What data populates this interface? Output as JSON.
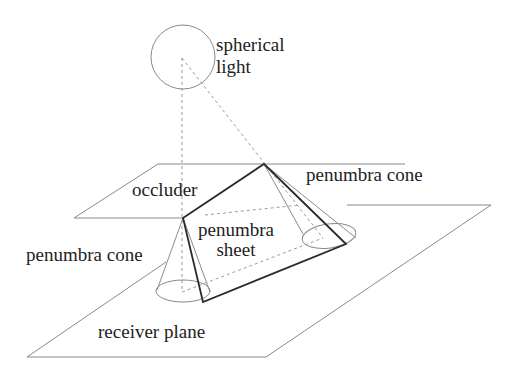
{
  "diagram": {
    "type": "3d-geometry-illustration",
    "labels": {
      "spherical_light_line1": "spherical",
      "spherical_light_line2": "light",
      "occluder": "occluder",
      "penumbra_cone_right": "penumbra cone",
      "penumbra_cone_left": "penumbra cone",
      "penumbra_sheet_line1": "penumbra",
      "penumbra_sheet_line2": "sheet",
      "receiver_plane": "receiver plane"
    },
    "colors": {
      "thin_line": "#8a8a8a",
      "bold_line": "#2a2a2a",
      "dashed_line": "#9a9a9a",
      "text": "#222222"
    },
    "elements": [
      {
        "id": "spherical-light",
        "shape": "circle"
      },
      {
        "id": "occluder",
        "shape": "parallelogram"
      },
      {
        "id": "receiver-plane",
        "shape": "parallelogram"
      },
      {
        "id": "penumbra-sheet",
        "shape": "quadrilateral"
      },
      {
        "id": "penumbra-cone-left",
        "shape": "cone"
      },
      {
        "id": "penumbra-cone-right",
        "shape": "cone"
      }
    ]
  }
}
